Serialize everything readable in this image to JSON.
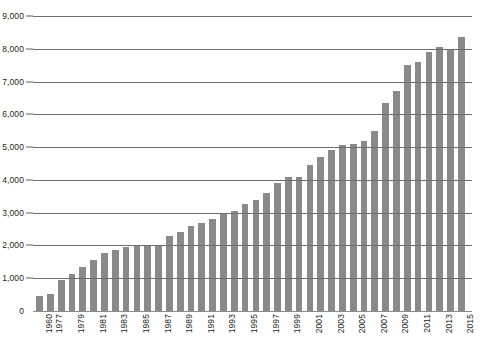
{
  "chart_data": {
    "type": "bar",
    "title": "",
    "subtitle": "",
    "xlabel": "",
    "ylabel": "",
    "ylim": [
      0,
      9000
    ],
    "ytick_step": 1000,
    "ytick_labels": [
      "0",
      "1,000",
      "2,000",
      "3,000",
      "4,000",
      "5,000",
      "6,000",
      "7,000",
      "8,000",
      "9,000"
    ],
    "ytick_values": [
      0,
      1000,
      2000,
      3000,
      4000,
      5000,
      6000,
      7000,
      8000,
      9000
    ],
    "grid": true,
    "grid_axis": "y",
    "legend": false,
    "legend_position": "none",
    "bar_color": "#8a8a8a",
    "grid_color": "#6e6e6e",
    "text_color": "#231f20",
    "background": "#ffffff",
    "xtick_label_rotation": -90,
    "xtick_labels_shown": [
      "1960",
      "1977",
      "1979",
      "1981",
      "1983",
      "1985",
      "1987",
      "1989",
      "1991",
      "1993",
      "1995",
      "1997",
      "1999",
      "2001",
      "2003",
      "2005",
      "2007",
      "2009",
      "2011",
      "2013",
      "2015"
    ],
    "categories": [
      "1960",
      "1977",
      "1978",
      "1979",
      "1980",
      "1981",
      "1982",
      "1983",
      "1984",
      "1985",
      "1986",
      "1987",
      "1988",
      "1989",
      "1990",
      "1991",
      "1992",
      "1993",
      "1994",
      "1995",
      "1996",
      "1997",
      "1998",
      "1999",
      "2000",
      "2001",
      "2002",
      "2003",
      "2004",
      "2005",
      "2006",
      "2007",
      "2008",
      "2009",
      "2010",
      "2011",
      "2012",
      "2013",
      "2014",
      "2015"
    ],
    "values": [
      450,
      530,
      950,
      1130,
      1340,
      1570,
      1780,
      1850,
      1950,
      1980,
      1990,
      2000,
      2300,
      2420,
      2600,
      2700,
      2800,
      2950,
      3050,
      3250,
      3400,
      3600,
      3900,
      4080,
      4100,
      4450,
      4700,
      4900,
      5050,
      5100,
      5200,
      5500,
      6350,
      6700,
      7500,
      7600,
      7900,
      8060,
      7980,
      8350
    ]
  }
}
